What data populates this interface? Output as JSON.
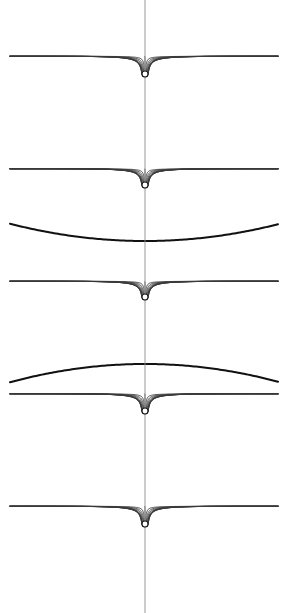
{
  "figure": {
    "canvas": {
      "width": 288,
      "height": 613,
      "background": "#ffffff"
    },
    "plot_area": {
      "x_min": 10,
      "x_max": 278,
      "y_min": 0,
      "y_max": 613
    },
    "axis": {
      "name": "vertical-symmetry-axis",
      "x": 145,
      "color": "#8c8c8c",
      "width": 0.9
    },
    "style": {
      "fieldline_color": "#3a3a3a",
      "fieldline_width": 0.85,
      "separatrix_color": "#111111",
      "separatrix_width": 2.0,
      "node_fill": "#ffffff",
      "node_stroke": "#1a1a1a",
      "node_radius": 3.0
    }
  },
  "chart_data": {
    "type": "line",
    "xlabel": "",
    "ylabel": "",
    "grid": false,
    "legend": "none",
    "xlim": [
      10,
      278
    ],
    "ylim": [
      0,
      613
    ],
    "axis_x": 145,
    "period": 112.5,
    "nodes": [
      {
        "id": "node-1",
        "x": 145,
        "y": 74,
        "polarity": "source",
        "rays": 26
      },
      {
        "id": "node-2",
        "x": 145,
        "y": 185,
        "polarity": "sink",
        "rays": 26
      },
      {
        "id": "node-3",
        "x": 145,
        "y": 297,
        "polarity": "source",
        "rays": 26
      },
      {
        "id": "node-4",
        "x": 145,
        "y": 411,
        "polarity": "sink",
        "rays": 26
      },
      {
        "id": "node-5",
        "x": 145,
        "y": 524,
        "polarity": "source",
        "rays": 26
      }
    ],
    "separatrices": [
      {
        "id": "separatrix-upper",
        "y_center": 241,
        "y_edge": 224,
        "curvature": "concave-up",
        "between_nodes": [
          "node-2",
          "node-3"
        ],
        "emphasis": "bold"
      },
      {
        "id": "separatrix-lower",
        "y_center": 364,
        "y_edge": 382,
        "curvature": "concave-down",
        "between_nodes": [
          "node-3",
          "node-4"
        ],
        "emphasis": "bold"
      }
    ]
  }
}
